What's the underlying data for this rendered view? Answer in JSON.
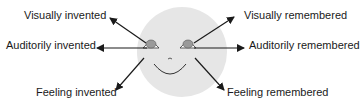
{
  "diagram": {
    "face_color": "#e6e6e6",
    "iris_color": "#9a9a9a",
    "line_color": "#1a1a1a",
    "labels": {
      "visually_invented": "Visually invented",
      "auditorily_invented": "Auditorily invented",
      "feeling_invented": "Feeling invented",
      "visually_remembered": "Visually remembered",
      "auditorily_remembered": "Auditorily remembered",
      "feeling_remembered": "Feeling remembered"
    }
  }
}
